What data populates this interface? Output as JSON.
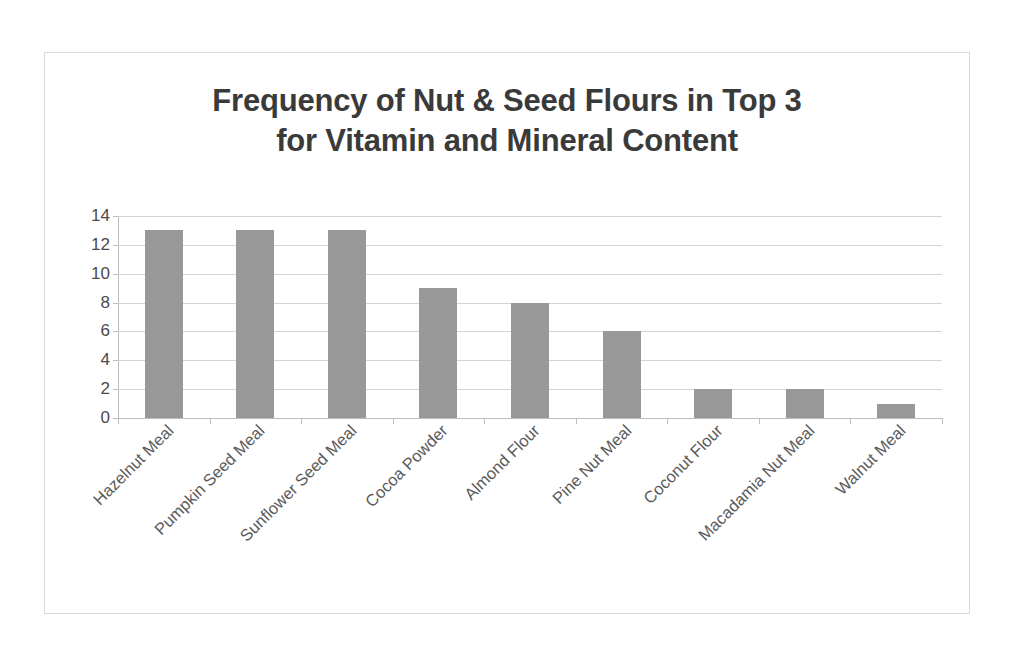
{
  "chart_data": {
    "type": "bar",
    "title": "Frequency of Nut & Seed Flours in Top 3 for Vitamin and Mineral Content",
    "title_lines": [
      "Frequency of Nut & Seed Flours in Top 3",
      "for Vitamin and Mineral Content"
    ],
    "categories": [
      "Hazelnut Meal",
      "Pumpkin Seed Meal",
      "Sunflower Seed Meal",
      "Cocoa Powder",
      "Almond Flour",
      "Pine Nut Meal",
      "Coconut Flour",
      "Macadamia Nut Meal",
      "Walnut Meal"
    ],
    "values": [
      13,
      13,
      13,
      9,
      8,
      6,
      2,
      2,
      1
    ],
    "xlabel": "",
    "ylabel": "",
    "ylim": [
      0,
      14
    ],
    "ytick_labels": [
      "14",
      "12",
      "10",
      "8",
      "6",
      "4",
      "2",
      "0"
    ],
    "ytick_values": [
      14,
      12,
      10,
      8,
      6,
      4,
      2,
      0
    ],
    "grid": true,
    "grid_axis": "y",
    "legend": false,
    "legend_position": "none",
    "bar_color": "#989898",
    "gridline_color": "#d4d4d4",
    "axis_color": "#bdbdbd",
    "title_color": "#3a3a3a",
    "tick_label_color": "#4a4a4a",
    "category_label_color": "#5a5a5a",
    "category_label_rotation": -45,
    "background_color": "#ffffff",
    "frame_border_color": "#d9d9d9"
  }
}
